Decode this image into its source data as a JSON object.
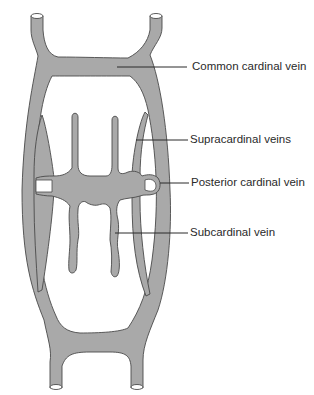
{
  "figure": {
    "colors": {
      "vessel_fill": "#a9a9a9",
      "vessel_outline": "#4a4a4a",
      "leader_line": "#2a2a2a",
      "background": "#ffffff"
    },
    "labels": [
      {
        "id": "common-cardinal",
        "text": "Common cardinal vein"
      },
      {
        "id": "supracardinal",
        "text": "Supracardinal veins"
      },
      {
        "id": "posterior-cardinal",
        "text": "Posterior cardinal vein"
      },
      {
        "id": "subcardinal",
        "text": "Subcardinal vein"
      }
    ]
  }
}
